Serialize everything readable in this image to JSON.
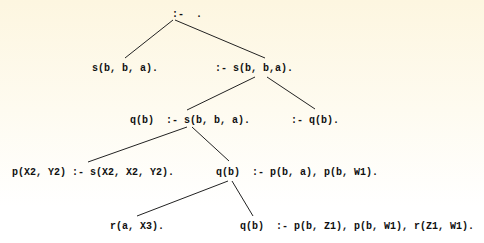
{
  "diagram": {
    "type": "sld-resolution-tree",
    "nodes": [
      {
        "id": "n0",
        "label": ":-  .",
        "x": 172,
        "y": 9
      },
      {
        "id": "n1",
        "label": "s(b, b, a).",
        "x": 92,
        "y": 63
      },
      {
        "id": "n2",
        "label": ":- s(b, b,a).",
        "x": 215,
        "y": 63
      },
      {
        "id": "n3",
        "label": "q(b)  :- s(b, b, a).",
        "x": 130,
        "y": 115
      },
      {
        "id": "n4",
        "label": ":- q(b).",
        "x": 291,
        "y": 115
      },
      {
        "id": "n5",
        "label": "p(X2, Y2) :- s(X2, X2, Y2).",
        "x": 12,
        "y": 167
      },
      {
        "id": "n6",
        "label": "q(b)  :- p(b, a), p(b, W1).",
        "x": 216,
        "y": 167
      },
      {
        "id": "n7",
        "label": "r(a, X3).",
        "x": 110,
        "y": 221
      },
      {
        "id": "n8",
        "label": "q(b)  :- p(b, Z1), p(b, W1), r(Z1, W1).",
        "x": 240,
        "y": 221
      }
    ],
    "edges": [
      {
        "from": "n0",
        "to": "n1",
        "x1": 173,
        "y1": 20,
        "x2": 125,
        "y2": 58
      },
      {
        "from": "n0",
        "to": "n2",
        "x1": 175,
        "y1": 20,
        "x2": 265,
        "y2": 58
      },
      {
        "from": "n2",
        "to": "n3",
        "x1": 255,
        "y1": 77,
        "x2": 187,
        "y2": 110
      },
      {
        "from": "n2",
        "to": "n4",
        "x1": 267,
        "y1": 77,
        "x2": 315,
        "y2": 109
      },
      {
        "from": "n3",
        "to": "n5",
        "x1": 187,
        "y1": 127,
        "x2": 88,
        "y2": 162
      },
      {
        "from": "n3",
        "to": "n6",
        "x1": 192,
        "y1": 127,
        "x2": 229,
        "y2": 161
      },
      {
        "from": "n6",
        "to": "n7",
        "x1": 228,
        "y1": 181,
        "x2": 137,
        "y2": 216
      },
      {
        "from": "n6",
        "to": "n8",
        "x1": 232,
        "y1": 181,
        "x2": 253,
        "y2": 216
      }
    ],
    "colors": {
      "line": "#222222",
      "text": "#111111",
      "background_top": "#fdf6e0",
      "background_bottom": "#ffffff"
    }
  }
}
